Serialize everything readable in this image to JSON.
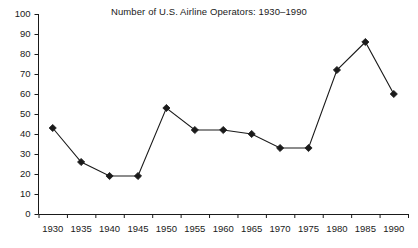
{
  "chart": {
    "title": "Number of U.S. Airline Operators: 1930–1990"
  },
  "chart_data": {
    "type": "line",
    "title": "Number of U.S. Airline Operators: 1930–1990",
    "xlabel": "",
    "ylabel": "",
    "categories": [
      "1930",
      "1935",
      "1940",
      "1945",
      "1950",
      "1955",
      "1960",
      "1965",
      "1970",
      "1975",
      "1980",
      "1985",
      "1990"
    ],
    "values": [
      43,
      26,
      19,
      19,
      53,
      42,
      42,
      40,
      33,
      33,
      72,
      86,
      60
    ],
    "ylim": [
      0,
      100
    ],
    "yticks": [
      0,
      10,
      20,
      30,
      40,
      50,
      60,
      70,
      80,
      90,
      100
    ],
    "ytick_labels": [
      "0",
      "10",
      "20",
      "30",
      "40",
      "50",
      "60",
      "70",
      "80",
      "90",
      "100"
    ],
    "grid": false,
    "legend": false,
    "marker": "diamond",
    "line_color": "#1a1a1a",
    "marker_color": "#1a1a1a"
  }
}
